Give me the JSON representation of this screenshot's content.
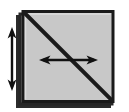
{
  "figure": {
    "title": "Paper folding diagram: square sheet with diagonal fold line",
    "type": "origami-fold-step",
    "canvas": {
      "width": 129,
      "height": 112,
      "background": "#ffffff"
    },
    "colors": {
      "sheet_fill": "#c8c8c8",
      "sheet_border": "#1a1a1a",
      "back_sheet_fill": "#b4b4b4",
      "back_sheet_border": "#2b2b2b",
      "fold_line": "#1a1a1a",
      "arrow": "#111111",
      "highlight_edge": "#e6e6e6"
    },
    "sheet": {
      "label": "square-sheet",
      "x": 22,
      "y": 11,
      "width": 92,
      "height": 92,
      "fill": "#c8c8c8",
      "stroke_width": 3
    },
    "back_sheet": {
      "label": "back-sheet-layer",
      "x": 18,
      "y": 15,
      "width": 92,
      "height": 92,
      "offset_x": -4,
      "offset_y": 4
    },
    "fold_line": {
      "label": "diagonal-fold-line",
      "from": {
        "x": 25,
        "y": 14
      },
      "to": {
        "x": 111,
        "y": 100
      },
      "direction": "top-left-to-bottom-right",
      "stroke_width": 4
    },
    "arrows": [
      {
        "name": "vertical-double-arrow",
        "orientation": "vertical",
        "double_headed": true,
        "x": 12,
        "y_start": 28,
        "y_end": 90,
        "length": 62,
        "shaft_width": 2,
        "head_width": 9,
        "head_length": 10,
        "position": "left-outside-sheet"
      },
      {
        "name": "horizontal-double-arrow",
        "orientation": "horizontal",
        "double_headed": true,
        "y": 60,
        "x_start": 40,
        "x_end": 97,
        "length": 57,
        "shaft_width": 2,
        "head_width": 9,
        "head_length": 10,
        "position": "center-inside-sheet"
      }
    ]
  }
}
